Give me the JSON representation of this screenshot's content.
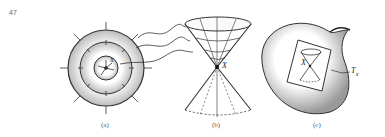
{
  "page_number": "47",
  "panels": [
    {
      "id": "a",
      "caption": "(a)",
      "point_label": "X"
    },
    {
      "id": "b",
      "caption": "(b)",
      "point_label": "X"
    },
    {
      "id": "c",
      "caption": "(c)",
      "point_label": "X",
      "tangent_label": "T",
      "tangent_subscript": "X"
    }
  ]
}
